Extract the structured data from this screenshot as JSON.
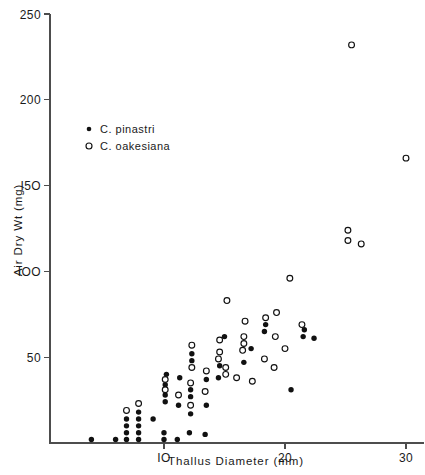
{
  "chart_data": {
    "type": "scatter",
    "title": "",
    "xlabel": "Thallus  Diameter  (mm)",
    "ylabel": "Air  Dry  Wt  (mg)",
    "xlim": [
      0,
      31.5
    ],
    "ylim": [
      0,
      250
    ],
    "xticks": [
      10,
      20,
      30
    ],
    "xtick_labels": [
      "IO",
      "20",
      "30"
    ],
    "yticks": [
      50,
      100,
      150,
      200,
      250
    ],
    "ytick_labels": [
      "50",
      "IOO",
      "I5O",
      "200",
      "250"
    ],
    "grid": false,
    "legend_position": "upper-left-inside",
    "series": [
      {
        "name": "C.  pinastri",
        "marker": "filled-circle",
        "color": "#111111",
        "points": [
          [
            4.0,
            2
          ],
          [
            6.0,
            2
          ],
          [
            6.9,
            2
          ],
          [
            6.9,
            6
          ],
          [
            6.9,
            10
          ],
          [
            6.9,
            14
          ],
          [
            7.9,
            2
          ],
          [
            7.9,
            6
          ],
          [
            7.9,
            10
          ],
          [
            7.9,
            14
          ],
          [
            7.9,
            18
          ],
          [
            9.1,
            14
          ],
          [
            10.0,
            2
          ],
          [
            10.0,
            6
          ],
          [
            10.1,
            24
          ],
          [
            10.1,
            28
          ],
          [
            10.1,
            34
          ],
          [
            10.2,
            40
          ],
          [
            11.1,
            2
          ],
          [
            11.2,
            22
          ],
          [
            11.3,
            38
          ],
          [
            12.1,
            6
          ],
          [
            12.2,
            17
          ],
          [
            12.2,
            27
          ],
          [
            12.2,
            31
          ],
          [
            12.3,
            48
          ],
          [
            12.3,
            52
          ],
          [
            13.4,
            5
          ],
          [
            13.5,
            22
          ],
          [
            13.5,
            37
          ],
          [
            14.5,
            38
          ],
          [
            14.6,
            45
          ],
          [
            15.0,
            62
          ],
          [
            16.6,
            47
          ],
          [
            17.2,
            55
          ],
          [
            18.3,
            65
          ],
          [
            18.4,
            69
          ],
          [
            20.5,
            31
          ],
          [
            21.5,
            62
          ],
          [
            21.6,
            66
          ],
          [
            22.4,
            61
          ]
        ]
      },
      {
        "name": "C.  oakesiana",
        "marker": "open-circle",
        "color": "#111111",
        "points": [
          [
            6.9,
            19
          ],
          [
            7.9,
            23
          ],
          [
            10.1,
            31
          ],
          [
            10.1,
            37
          ],
          [
            11.2,
            28
          ],
          [
            12.2,
            22
          ],
          [
            12.2,
            35
          ],
          [
            12.3,
            44
          ],
          [
            12.3,
            57
          ],
          [
            13.4,
            30
          ],
          [
            13.5,
            42
          ],
          [
            14.5,
            49
          ],
          [
            14.6,
            53
          ],
          [
            14.6,
            60
          ],
          [
            15.1,
            40
          ],
          [
            15.1,
            44
          ],
          [
            15.2,
            83
          ],
          [
            16.0,
            38
          ],
          [
            16.5,
            54
          ],
          [
            16.6,
            58
          ],
          [
            16.6,
            62
          ],
          [
            16.7,
            71
          ],
          [
            17.3,
            36
          ],
          [
            18.3,
            49
          ],
          [
            18.4,
            73
          ],
          [
            19.1,
            44
          ],
          [
            19.2,
            62
          ],
          [
            19.3,
            76
          ],
          [
            20.0,
            55
          ],
          [
            20.4,
            96
          ],
          [
            21.4,
            69
          ],
          [
            25.2,
            118
          ],
          [
            25.2,
            124
          ],
          [
            25.5,
            232
          ],
          [
            26.3,
            116
          ],
          [
            30.0,
            166
          ]
        ]
      }
    ]
  },
  "legend": {
    "entries": [
      {
        "symbol": "filled-circle",
        "label": "C.  pinastri"
      },
      {
        "symbol": "open-circle",
        "label": "C.  oakesiana"
      }
    ]
  },
  "axes": {
    "y_title": "Air  Dry  Wt  (mg)",
    "x_title": "Thallus  Diameter  (mm)"
  }
}
